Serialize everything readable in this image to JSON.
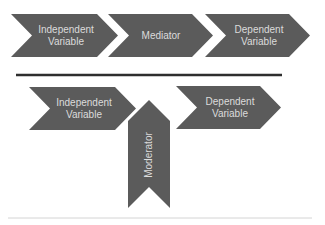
{
  "mediation": {
    "steps": [
      {
        "line1": "Independent",
        "line2": "Variable"
      },
      {
        "line1": "Mediator",
        "line2": ""
      },
      {
        "line1": "Dependent",
        "line2": "Variable"
      }
    ]
  },
  "moderation": {
    "independent": {
      "line1": "Independent",
      "line2": "Variable"
    },
    "dependent": {
      "line1": "Dependent",
      "line2": "Variable"
    },
    "moderator": {
      "label": "Moderator"
    }
  },
  "colors": {
    "shape_fill": "#5b5b5b",
    "label_text": "#dcdcdc",
    "divider": "#2e2e2e"
  }
}
